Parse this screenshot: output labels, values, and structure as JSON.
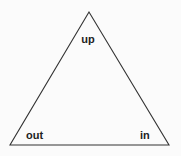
{
  "diagram": {
    "shape": "triangle",
    "stroke_color": "#333333",
    "background": "#fbfbfb",
    "vertices": {
      "top": {
        "label": "up"
      },
      "bottom_left": {
        "label": "out"
      },
      "bottom_right": {
        "label": "in"
      }
    }
  }
}
